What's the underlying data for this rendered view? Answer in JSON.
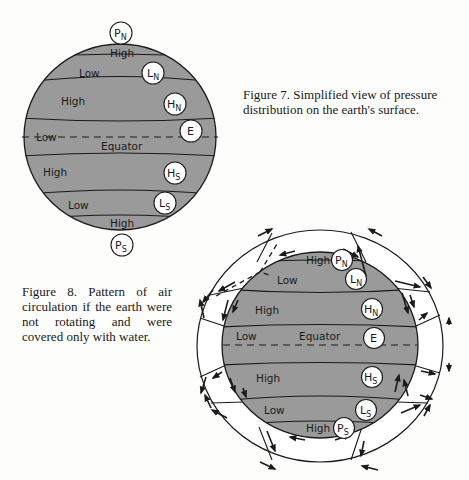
{
  "figure7": {
    "caption": "Figure 7.  Simplified view of pressure distribution on the earth's surface.",
    "bands": [
      "High",
      "Low",
      "High",
      "Low",
      "Equator",
      "High",
      "Low",
      "High"
    ],
    "labels": {
      "high_n_top": "High",
      "low_n": "Low",
      "high_n": "High",
      "low_eq": "Low",
      "equator": "Equator",
      "high_s": "High",
      "low_s": "Low",
      "high_s_bottom": "High"
    },
    "markers": {
      "pn": {
        "main": "P",
        "sub": "N"
      },
      "ln": {
        "main": "L",
        "sub": "N"
      },
      "hn": {
        "main": "H",
        "sub": "N"
      },
      "e": {
        "main": "E"
      },
      "hs": {
        "main": "H",
        "sub": "S"
      },
      "ls": {
        "main": "L",
        "sub": "S"
      },
      "ps": {
        "main": "P",
        "sub": "S"
      }
    }
  },
  "figure8": {
    "caption": "Figure 8.  Pattern of air circulation if the earth were not rotating and were covered only with water.",
    "labels": {
      "high_n_top": "High",
      "low_n": "Low",
      "high_n": "High",
      "low_eq": "Low",
      "equator": "Equator",
      "high_s": "High",
      "low_s": "Low",
      "high_s_bottom": "High"
    },
    "markers": {
      "pn": {
        "main": "P",
        "sub": "N"
      },
      "ln": {
        "main": "L",
        "sub": "N"
      },
      "hn": {
        "main": "H",
        "sub": "N"
      },
      "e": {
        "main": "E"
      },
      "hs": {
        "main": "H",
        "sub": "S"
      },
      "ls": {
        "main": "L",
        "sub": "S"
      },
      "ps": {
        "main": "P",
        "sub": "S"
      }
    }
  },
  "colors": {
    "globe": "#9a9a9a",
    "line": "#1a1a1a",
    "marker_fill": "#ffffff"
  }
}
